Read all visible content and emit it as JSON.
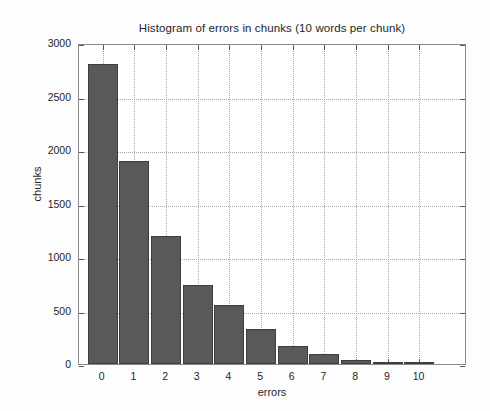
{
  "chart_data": {
    "type": "bar",
    "title": "Histogram of errors in chunks (10 words per chunk)",
    "xlabel": "errors",
    "ylabel": "chunks",
    "categories": [
      "0",
      "1",
      "2",
      "3",
      "4",
      "5",
      "6",
      "7",
      "8",
      "9",
      "10"
    ],
    "values": [
      2800,
      1900,
      1200,
      740,
      550,
      330,
      170,
      95,
      40,
      15,
      5
    ],
    "xtick_labels": [
      "0",
      "1",
      "2",
      "3",
      "4",
      "5",
      "6",
      "7",
      "8",
      "9",
      "10"
    ],
    "ytick_labels": [
      "0",
      "500",
      "1000",
      "1500",
      "2000",
      "2500",
      "3000"
    ],
    "ytick_values": [
      0,
      500,
      1000,
      1500,
      2000,
      2500,
      3000
    ],
    "ylim": [
      0,
      3000
    ],
    "xlim": [
      -0.75,
      11.5
    ],
    "grid": true,
    "legend": null,
    "bar_color": "#595959",
    "bar_edge_color": "#3d3d3d",
    "grid_color": "#a9a9a9",
    "axis_color": "#8a8a8a",
    "background_color": "#ffffff"
  }
}
